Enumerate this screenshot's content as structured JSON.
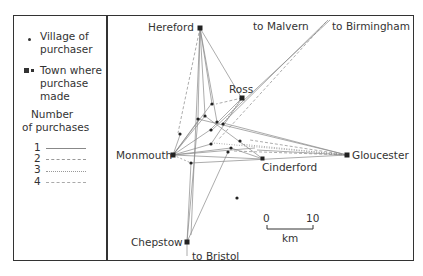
{
  "legend": {
    "village_label_line1": "Village of",
    "village_label_line2": "purchaser",
    "town_label_line1": "Town where",
    "town_label_line2": "purchase",
    "town_label_line3": "made",
    "count_title_line1": "Number",
    "count_title_line2": "of purchases",
    "counts": [
      {
        "n": "1",
        "style": "solid"
      },
      {
        "n": "2",
        "style": "dashed"
      },
      {
        "n": "3",
        "style": "dotted"
      },
      {
        "n": "4",
        "style": "dash-dot"
      }
    ]
  },
  "towns": {
    "hereford": "Hereford",
    "ross": "Ross",
    "monmouth": "Monmouth",
    "gloucester": "Gloucester",
    "cinderford": "Cinderford",
    "chepstow": "Chepstow"
  },
  "external": {
    "malvern": "to Malvern",
    "birmingham": "to Birmingham",
    "bristol": "to Bristol"
  },
  "scale": {
    "start": "0",
    "end": "10",
    "unit": "km"
  },
  "colors": {
    "ink": "#333333",
    "line": "#777777",
    "background": "#ffffff"
  }
}
